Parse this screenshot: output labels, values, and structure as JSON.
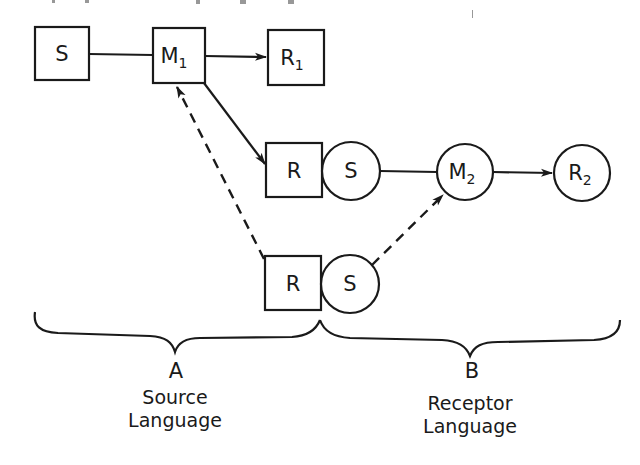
{
  "diagram": {
    "type": "communication-model",
    "nodes": {
      "s1": {
        "label": "S",
        "sub": "",
        "shape": "square"
      },
      "m1": {
        "label": "M",
        "sub": "1",
        "shape": "square"
      },
      "r1": {
        "label": "R",
        "sub": "1",
        "shape": "square"
      },
      "r_mid": {
        "label": "R",
        "sub": "",
        "shape": "square"
      },
      "s_mid": {
        "label": "S",
        "sub": "",
        "shape": "circle"
      },
      "r_low": {
        "label": "R",
        "sub": "",
        "shape": "square"
      },
      "s_low": {
        "label": "S",
        "sub": "",
        "shape": "circle"
      },
      "m2": {
        "label": "M",
        "sub": "2",
        "shape": "circle"
      },
      "r2": {
        "label": "R",
        "sub": "2",
        "shape": "circle"
      }
    },
    "edges": [
      {
        "from": "s1",
        "to": "m1",
        "style": "solid",
        "arrow": false
      },
      {
        "from": "m1",
        "to": "r1",
        "style": "solid",
        "arrow": true
      },
      {
        "from": "m1",
        "to": "r_mid",
        "style": "solid",
        "arrow": true
      },
      {
        "from": "r_low",
        "to": "m1",
        "style": "dashed",
        "arrow": true
      },
      {
        "from": "s_mid",
        "to": "m2",
        "style": "solid",
        "arrow": false
      },
      {
        "from": "s_low",
        "to": "m2",
        "style": "dashed",
        "arrow": true
      },
      {
        "from": "m2",
        "to": "r2",
        "style": "solid",
        "arrow": true
      }
    ],
    "groups": [
      {
        "letter": "A",
        "line1": "Source",
        "line2": "Language"
      },
      {
        "letter": "B",
        "line1": "Receptor",
        "line2": "Language"
      }
    ],
    "colors": {
      "ink": "#1a1a1a",
      "background": "#ffffff"
    }
  }
}
